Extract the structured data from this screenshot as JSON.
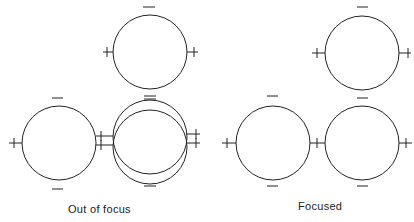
{
  "panels": [
    {
      "label": "Out of focus",
      "circles": [
        {
          "cx": 150,
          "cy": 52,
          "r": 37
        },
        {
          "cx": 59,
          "cy": 143,
          "r": 37
        },
        {
          "cx": 150,
          "cy": 137,
          "r": 37
        },
        {
          "cx": 150,
          "cy": 147,
          "r": 37
        }
      ]
    },
    {
      "label": "Focused",
      "circles": [
        {
          "cx": 362,
          "cy": 53,
          "r": 37
        },
        {
          "cx": 273,
          "cy": 143,
          "r": 37
        },
        {
          "cx": 362,
          "cy": 143,
          "r": 37
        }
      ]
    }
  ],
  "symbols": {
    "plus": "+",
    "minus": "−"
  },
  "colors": {
    "stroke": "#222222",
    "background": "#ffffff"
  }
}
